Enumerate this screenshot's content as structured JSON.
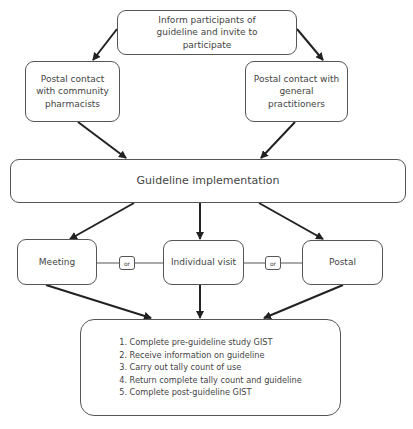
{
  "nodes": {
    "inform": "Inform participants of guideline and invite to participate",
    "pharmacists": "Postal contact with community pharmacists",
    "gps": "Postal contact with general practitioners",
    "implementation": "Guideline implementation",
    "meeting": "Meeting",
    "individual_visit": "Individual visit",
    "postal": "Postal",
    "or_left": "or",
    "or_right": "or"
  },
  "steps": [
    "1. Complete pre-guideline study GIST",
    "2. Receive information on guideline",
    "3. Carry out tally count of use",
    "4. Return complete tally count and guideline",
    "5. Complete post-guideline GIST"
  ],
  "colors": {
    "stroke": "#555555",
    "arrow": "#222222",
    "text": "#444444"
  }
}
